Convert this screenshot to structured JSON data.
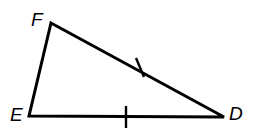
{
  "figure": {
    "kind": "geometry-diagram",
    "shape_name": "triangle",
    "background_color": "#ffffff",
    "stroke_color": "#000000",
    "stroke_width": 3,
    "canvas": {
      "width": 255,
      "height": 138
    },
    "vertices": [
      {
        "id": "F",
        "label": "F",
        "x": 51,
        "y": 23,
        "label_x": 31,
        "label_y": 10
      },
      {
        "id": "E",
        "label": "E",
        "x": 29,
        "y": 116,
        "label_x": 10,
        "label_y": 105
      },
      {
        "id": "D",
        "label": "D",
        "x": 224,
        "y": 117,
        "label_x": 229,
        "label_y": 104
      }
    ],
    "sides": [
      {
        "id": "EF",
        "from": "E",
        "to": "F",
        "tick_count": 0
      },
      {
        "id": "FD",
        "from": "F",
        "to": "D",
        "tick_count": 1
      },
      {
        "id": "ED",
        "from": "E",
        "to": "D",
        "tick_count": 1
      }
    ],
    "tick_marks": [
      {
        "id": "tick-FD",
        "on_side": "FD",
        "x1": 136,
        "y1": 58,
        "x2": 144,
        "y2": 77
      },
      {
        "id": "tick-ED",
        "on_side": "ED",
        "x1": 126,
        "y1": 106,
        "x2": 126,
        "y2": 128
      }
    ],
    "path_points": "51,23 224,117 29,116"
  }
}
